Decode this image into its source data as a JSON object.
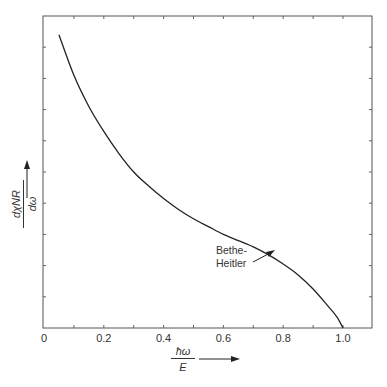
{
  "chart_data": {
    "type": "line",
    "title": "",
    "xlabel": "ħω / E",
    "ylabel": "dχ_NR / dω",
    "x_ticks": [
      "0",
      "0.2",
      "0.4",
      "0.6",
      "0.8",
      "1.0"
    ],
    "xlim": [
      0,
      1.1
    ],
    "ylim": [
      0,
      10
    ],
    "grid": false,
    "legend": null,
    "annotations": [
      {
        "text": "Bethe-\nHeitler",
        "points_to": [
          0.76,
          2.55
        ]
      }
    ],
    "series": [
      {
        "name": "Bethe-Heitler",
        "x": [
          0.05,
          0.1,
          0.15,
          0.2,
          0.25,
          0.3,
          0.35,
          0.4,
          0.45,
          0.5,
          0.55,
          0.6,
          0.65,
          0.7,
          0.75,
          0.8,
          0.85,
          0.9,
          0.95,
          0.98,
          1.0
        ],
        "y": [
          9.4,
          8.1,
          7.1,
          6.3,
          5.6,
          5.0,
          4.55,
          4.15,
          3.8,
          3.5,
          3.25,
          3.0,
          2.8,
          2.6,
          2.35,
          2.05,
          1.7,
          1.25,
          0.7,
          0.35,
          0.0
        ]
      }
    ]
  },
  "axis": {
    "x_label_num": "ħω",
    "x_label_den": "E",
    "y_label_num": "dχNR",
    "y_label_den": "dω",
    "arrow": "→"
  },
  "annotation": {
    "line1": "Bethe-",
    "line2": "Heitler"
  }
}
